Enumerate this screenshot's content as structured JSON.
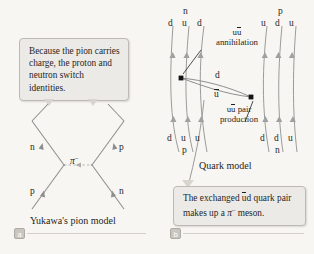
{
  "figure": {
    "background_color": "#f7f6f2",
    "line_color": "#8d8d8d",
    "vertex_color": "#1a1a1a"
  },
  "panel_a": {
    "callout": "Because the pion carries charge, the proton and neutron switch identities.",
    "caption": "Yukawa's pion model",
    "badge": "a",
    "labels": {
      "in_neutron": "n",
      "in_proton": "p",
      "out_proton": "p",
      "out_neutron": "n",
      "exchange_particle": "π",
      "exchange_charge": "–"
    }
  },
  "panel_b": {
    "caption": "Quark model",
    "badge": "b",
    "callout_prefix": "The exchanged ",
    "callout_u": "u",
    "callout_mid": "d quark pair makes up a ",
    "callout_pi": "π",
    "callout_charge": "–",
    "callout_suffix": " meson.",
    "top_left_particle": "n",
    "top_left_quarks": [
      "d",
      "u",
      "d"
    ],
    "top_right_particle": "p",
    "top_right_quarks": [
      "u",
      "d",
      "u"
    ],
    "bottom_left_quarks": [
      "d",
      "u",
      "u"
    ],
    "bottom_left_particle": "p",
    "bottom_right_quarks": [
      "d",
      "d",
      "u"
    ],
    "bottom_right_particle": "n",
    "annihilation_pair_u": "u",
    "annihilation_pair_ubar": "u",
    "annihilation_label": "annihilation",
    "production_pair_u": "u",
    "production_pair_ubar": "u",
    "production_label_1": "pair",
    "production_label_2": "production",
    "exchanged_d": "d",
    "exchanged_ubar": "u"
  }
}
